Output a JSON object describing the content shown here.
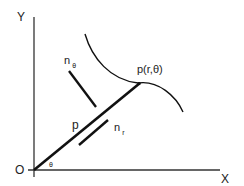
{
  "diagram": {
    "type": "polar-coordinate-vector-diagram",
    "axes": {
      "x_label": "X",
      "y_label": "Y",
      "origin_label": "O"
    },
    "point_label": "p(r,θ)",
    "position_vector_label": "p",
    "angle_label": "θ",
    "unit_vectors": {
      "radial": {
        "base": "n",
        "subscript": "r"
      },
      "angular": {
        "base": "n",
        "subscript": "θ"
      }
    },
    "colors": {
      "line": "#111111",
      "axis": "#333333",
      "text": "#222222"
    }
  }
}
